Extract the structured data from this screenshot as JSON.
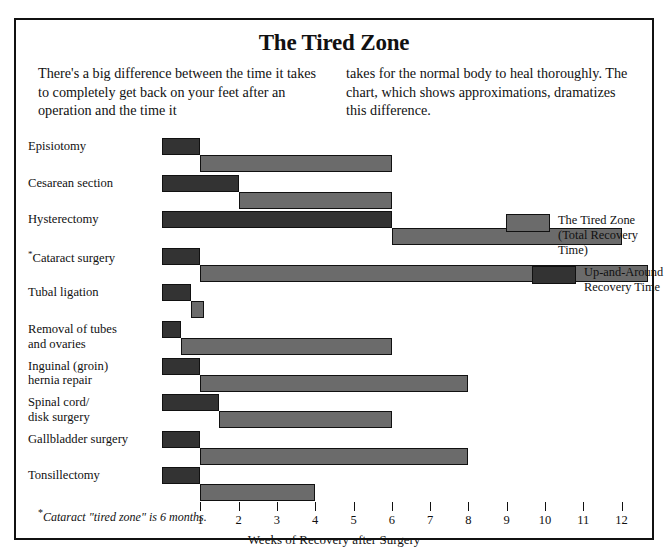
{
  "chart_title": "The Tired Zone",
  "intro": {
    "col1": "There's a big difference between the time it takes to completely get back on your feet after an operation and the time it",
    "col2": "takes for the normal body to heal thoroughly. The chart, which shows approximations, dramatizes this difference."
  },
  "footnote": {
    "star": "*",
    "text": "Cataract \"tired zone\" is 6 months."
  },
  "legend": {
    "items": [
      {
        "label_line1": "The Tired Zone",
        "label_line2": "(Total Recovery Time)",
        "color": "#6b6b6b",
        "key": "tired-zone"
      },
      {
        "label_line1": "Up-and-Around",
        "label_line2": "Recovery Time",
        "color": "#333333",
        "key": "up-and-around"
      }
    ]
  },
  "chart_data": {
    "type": "bar",
    "orientation": "horizontal",
    "title": "The Tired Zone",
    "xlabel": "Weeks of Recovery after Surgery",
    "ylabel": "",
    "xlim": [
      0,
      13
    ],
    "grid": false,
    "legend_position": "right-middle",
    "tick_labels": [
      "1",
      "2",
      "3",
      "4",
      "5",
      "6",
      "7",
      "8",
      "9",
      "10",
      "11",
      "12"
    ],
    "tick_values": [
      1,
      2,
      3,
      4,
      5,
      6,
      7,
      8,
      9,
      10,
      11,
      12
    ],
    "categories": [
      "Episiotomy",
      "Cesarean section",
      "Hysterectomy",
      "Cataract surgery",
      "Tubal ligation",
      "Removal of tubes and ovaries",
      "Inguinal (groin) hernia repair",
      "Spinal cord/ disk surgery",
      "Gallbladder surgery",
      "Tonsillectomy"
    ],
    "series": [
      {
        "name": "Up-and-Around Recovery Time",
        "color": "#333333",
        "values": [
          1,
          2,
          6,
          1,
          0.75,
          0.5,
          1,
          1.5,
          1,
          1
        ]
      },
      {
        "name": "The Tired Zone (Total Recovery Time)",
        "color": "#6b6b6b",
        "values": [
          6,
          6,
          12,
          12.7,
          1.1,
          6,
          8,
          6,
          8,
          4
        ]
      }
    ],
    "rows": [
      {
        "label_line1": "Episiotomy",
        "label_line2": "",
        "starred": false,
        "up": 1,
        "zone_end": 6
      },
      {
        "label_line1": "Cesarean section",
        "label_line2": "",
        "starred": false,
        "up": 2,
        "zone_end": 6
      },
      {
        "label_line1": "Hysterectomy",
        "label_line2": "",
        "starred": false,
        "up": 6,
        "zone_end": 12
      },
      {
        "label_line1": "Cataract surgery",
        "label_line2": "",
        "starred": true,
        "up": 1,
        "zone_end": 12.7
      },
      {
        "label_line1": "Tubal ligation",
        "label_line2": "",
        "starred": false,
        "up": 0.75,
        "zone_end": 1.1
      },
      {
        "label_line1": "Removal of tubes",
        "label_line2": "and ovaries",
        "starred": false,
        "up": 0.5,
        "zone_end": 6
      },
      {
        "label_line1": "Inguinal (groin)",
        "label_line2": "hernia repair",
        "starred": false,
        "up": 1,
        "zone_end": 8
      },
      {
        "label_line1": "Spinal cord/",
        "label_line2": "disk surgery",
        "starred": false,
        "up": 1.5,
        "zone_end": 6
      },
      {
        "label_line1": "Gallbladder surgery",
        "label_line2": "",
        "starred": false,
        "up": 1,
        "zone_end": 8
      },
      {
        "label_line1": "Tonsillectomy",
        "label_line2": "",
        "starred": false,
        "up": 1,
        "zone_end": 4
      }
    ]
  }
}
